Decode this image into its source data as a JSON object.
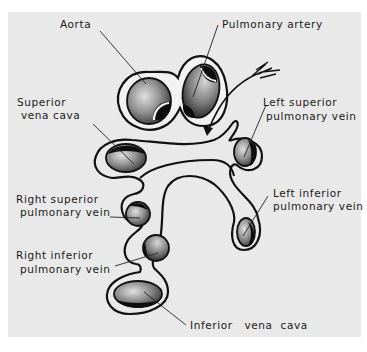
{
  "figure": {
    "colors": {
      "background": "#e9e9e9",
      "outline": "#111111",
      "vessel_fill": "#8a8a8a",
      "lumen": "#0d0d0d"
    }
  },
  "labels": {
    "aorta": "Aorta",
    "pulmonary_artery": "Pulmonary artery",
    "superior_vena_cava_line1": "Superior",
    "superior_vena_cava_line2": " vena cava",
    "left_superior_pv_line1": "Left superior",
    "left_superior_pv_line2": "pulmonary vein",
    "right_superior_pv_line1": "Right superior",
    "right_superior_pv_line2": " pulmonary vein",
    "left_inferior_pv_line1": "Left inferior",
    "left_inferior_pv_line2": "pulmonary vein",
    "right_inferior_pv_line1": "Right inferior",
    "right_inferior_pv_line2": " pulmonary vein",
    "inferior_vena_cava": "Inferior   vena  cava"
  },
  "structures": [
    {
      "name": "Aorta",
      "group": "arterial sheath"
    },
    {
      "name": "Pulmonary artery",
      "group": "arterial sheath"
    },
    {
      "name": "Superior vena cava",
      "group": "venous reflection"
    },
    {
      "name": "Left superior pulmonary vein",
      "group": "venous reflection"
    },
    {
      "name": "Right superior pulmonary vein",
      "group": "venous reflection"
    },
    {
      "name": "Left inferior pulmonary vein",
      "group": "venous reflection"
    },
    {
      "name": "Right inferior pulmonary vein",
      "group": "venous reflection"
    },
    {
      "name": "Inferior vena cava",
      "group": "venous reflection"
    }
  ],
  "annotations": {
    "arrow": "Arrow indicating passage through the transverse pericardial sinus"
  }
}
